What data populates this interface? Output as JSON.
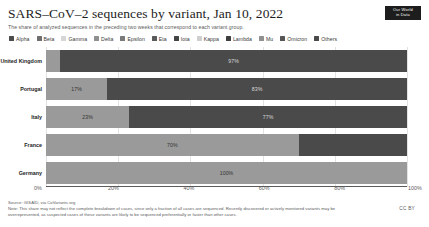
{
  "header": {
    "title": "SARS–CoV–2 sequences by variant, Jan 10, 2022",
    "subtitle": "The share of analyzed sequences in the preceding two weeks that correspond to each variant group.",
    "logo_line1": "Our World",
    "logo_line2": "in Data"
  },
  "footer": {
    "source": "Source: GISAID, via CoVariants.org",
    "note": "Note: This share may not reflect the complete breakdown of cases, since only a fraction of all cases are sequenced. Recently discovered or actively monitored variants may be overrepresented, as suspected cases of these variants are likely to be sequenced preferentially or faster than other cases.",
    "license": "CC BY"
  },
  "chart_data": {
    "type": "bar",
    "orientation": "horizontal",
    "stacked": true,
    "title": "SARS–CoV–2 sequences by variant, Jan 10, 2022",
    "subtitle": "The share of analyzed sequences in the preceding two weeks that correspond to each variant group.",
    "xlabel": "",
    "ylabel": "",
    "xlim": [
      0,
      100
    ],
    "xticks": [
      "0%",
      "20%",
      "40%",
      "60%",
      "80%",
      "100%"
    ],
    "xtick_values": [
      0,
      20,
      40,
      60,
      80,
      100
    ],
    "grid": true,
    "legend_position": "top",
    "legend": [
      {
        "name": "Alpha",
        "color": "#4c4c4c"
      },
      {
        "name": "Beta",
        "color": "#6e6e6e"
      },
      {
        "name": "Gamma",
        "color": "#d6d6d6"
      },
      {
        "name": "Delta",
        "color": "#8f8f8f"
      },
      {
        "name": "Epsilon",
        "color": "#7a7a7a"
      },
      {
        "name": "Eta",
        "color": "#5a5a5a"
      },
      {
        "name": "Iota",
        "color": "#444444"
      },
      {
        "name": "Kappa",
        "color": "#cfcfcf"
      },
      {
        "name": "Lambda",
        "color": "#3d3d3d"
      },
      {
        "name": "Mu",
        "color": "#909090"
      },
      {
        "name": "Omicron",
        "color": "#555555"
      },
      {
        "name": "Others",
        "color": "#4a4a4a"
      }
    ],
    "categories": [
      "United Kingdom",
      "Portugal",
      "Italy",
      "France",
      "Germany"
    ],
    "series": [
      {
        "name": "Delta",
        "color": "#9a9a9a",
        "values": [
          4,
          17,
          23,
          70,
          100
        ]
      },
      {
        "name": "Omicron",
        "color": "#4a4a4a",
        "values": [
          96,
          83,
          77,
          30,
          0
        ]
      }
    ],
    "rows": [
      {
        "category": "United Kingdom",
        "segments": [
          {
            "variant": "Delta",
            "value": 4,
            "label": "",
            "color": "#9a9a9a",
            "text_color": "#333333"
          },
          {
            "variant": "Omicron",
            "value": 96,
            "label": "97%",
            "color": "#4a4a4a",
            "text_color": "#d8d8d8"
          }
        ]
      },
      {
        "category": "Portugal",
        "segments": [
          {
            "variant": "Delta",
            "value": 17,
            "label": "17%",
            "color": "#9a9a9a",
            "text_color": "#333333"
          },
          {
            "variant": "Omicron",
            "value": 83,
            "label": "83%",
            "color": "#4a4a4a",
            "text_color": "#d8d8d8"
          }
        ]
      },
      {
        "category": "Italy",
        "segments": [
          {
            "variant": "Delta",
            "value": 23,
            "label": "23%",
            "color": "#9a9a9a",
            "text_color": "#333333"
          },
          {
            "variant": "Omicron",
            "value": 77,
            "label": "77%",
            "color": "#4a4a4a",
            "text_color": "#d8d8d8"
          }
        ]
      },
      {
        "category": "France",
        "segments": [
          {
            "variant": "Delta",
            "value": 70,
            "label": "70%",
            "color": "#9a9a9a",
            "text_color": "#333333"
          },
          {
            "variant": "Omicron",
            "value": 30,
            "label": "",
            "color": "#4a4a4a",
            "text_color": "#d8d8d8"
          }
        ]
      },
      {
        "category": "Germany",
        "segments": [
          {
            "variant": "Delta",
            "value": 100,
            "label": "100%",
            "color": "#9a9a9a",
            "text_color": "#333333"
          }
        ]
      }
    ]
  }
}
